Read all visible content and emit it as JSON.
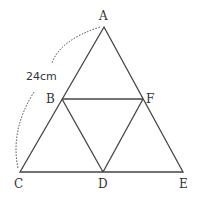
{
  "diagram": {
    "points": {
      "A": {
        "label": "A",
        "x": 104,
        "y": 27
      },
      "B": {
        "label": "B",
        "x": 62,
        "y": 99
      },
      "C": {
        "label": "C",
        "x": 20,
        "y": 172
      },
      "D": {
        "label": "D",
        "x": 103,
        "y": 172
      },
      "E": {
        "label": "E",
        "x": 183,
        "y": 172
      },
      "F": {
        "label": "F",
        "x": 143,
        "y": 99
      }
    },
    "measurement": {
      "label": "24cm",
      "segment": "AC"
    },
    "line_color": "#444444"
  }
}
